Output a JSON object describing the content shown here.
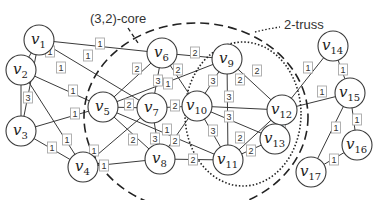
{
  "diagram": {
    "type": "weighted-graph",
    "annotations": {
      "core_label": "(3,2)-core",
      "truss_label": "2-truss"
    },
    "nodes": [
      {
        "id": "v1",
        "label": "v",
        "sub": "1",
        "x": 39,
        "y": 40
      },
      {
        "id": "v2",
        "label": "v",
        "sub": "2",
        "x": 21,
        "y": 70
      },
      {
        "id": "v3",
        "label": "v",
        "sub": "3",
        "x": 21,
        "y": 131
      },
      {
        "id": "v4",
        "label": "v",
        "sub": "4",
        "x": 83,
        "y": 167
      },
      {
        "id": "v5",
        "label": "v",
        "sub": "5",
        "x": 103,
        "y": 107
      },
      {
        "id": "v6",
        "label": "v",
        "sub": "6",
        "x": 162,
        "y": 53
      },
      {
        "id": "v7",
        "label": "v",
        "sub": "7",
        "x": 152,
        "y": 108
      },
      {
        "id": "v8",
        "label": "v",
        "sub": "8",
        "x": 160,
        "y": 159
      },
      {
        "id": "v9",
        "label": "v",
        "sub": "9",
        "x": 227,
        "y": 59
      },
      {
        "id": "v10",
        "label": "v",
        "sub": "10",
        "x": 197,
        "y": 106
      },
      {
        "id": "v11",
        "label": "v",
        "sub": "11",
        "x": 228,
        "y": 160
      },
      {
        "id": "v12",
        "label": "v",
        "sub": "12",
        "x": 282,
        "y": 110
      },
      {
        "id": "v13",
        "label": "v",
        "sub": "13",
        "x": 275,
        "y": 139
      },
      {
        "id": "v14",
        "label": "v",
        "sub": "14",
        "x": 333,
        "y": 46
      },
      {
        "id": "v15",
        "label": "v",
        "sub": "15",
        "x": 350,
        "y": 93
      },
      {
        "id": "v16",
        "label": "v",
        "sub": "16",
        "x": 357,
        "y": 145
      },
      {
        "id": "v17",
        "label": "v",
        "sub": "17",
        "x": 311,
        "y": 172
      }
    ],
    "edges": [
      {
        "from": "v1",
        "to": "v2",
        "weight": "1",
        "lx": 50,
        "ly": 52
      },
      {
        "from": "v1",
        "to": "v3",
        "weight": "1",
        "lx": 61,
        "ly": 68
      },
      {
        "from": "v1",
        "to": "v6",
        "weight": "1",
        "lx": 100,
        "ly": 44
      },
      {
        "from": "v1",
        "to": "v7",
        "weight": "1",
        "lx": 88,
        "ly": 56
      },
      {
        "from": "v2",
        "to": "v3",
        "weight": "3",
        "lx": 28,
        "ly": 98
      },
      {
        "from": "v2",
        "to": "v5",
        "weight": "1",
        "lx": 73,
        "ly": 91
      },
      {
        "from": "v2",
        "to": "v4",
        "weight": "1",
        "lx": 67,
        "ly": 140
      },
      {
        "from": "v3",
        "to": "v5",
        "weight": "1",
        "lx": 75,
        "ly": 114
      },
      {
        "from": "v3",
        "to": "v4",
        "weight": "1",
        "lx": 52,
        "ly": 148
      },
      {
        "from": "v4",
        "to": "v7",
        "weight": "1",
        "lx": 94,
        "ly": 151
      },
      {
        "from": "v4",
        "to": "v8",
        "weight": "1",
        "lx": 104,
        "ly": 166
      },
      {
        "from": "v5",
        "to": "v6",
        "weight": "2",
        "lx": 137,
        "ly": 69
      },
      {
        "from": "v5",
        "to": "v7",
        "weight": "2",
        "lx": 129,
        "ly": 105
      },
      {
        "from": "v5",
        "to": "v8",
        "weight": "2",
        "lx": 133,
        "ly": 140
      },
      {
        "from": "v5",
        "to": "v9",
        "weight": "1",
        "lx": 168,
        "ly": 84
      },
      {
        "from": "v5",
        "to": "v11",
        "weight": "1",
        "lx": 167,
        "ly": 130
      },
      {
        "from": "v6",
        "to": "v7",
        "weight": "3",
        "lx": 158,
        "ly": 81
      },
      {
        "from": "v6",
        "to": "v9",
        "weight": "2",
        "lx": 195,
        "ly": 53
      },
      {
        "from": "v6",
        "to": "v10",
        "weight": "2",
        "lx": 178,
        "ly": 70
      },
      {
        "from": "v7",
        "to": "v8",
        "weight": "3",
        "lx": 155,
        "ly": 139
      },
      {
        "from": "v7",
        "to": "v10",
        "weight": "2",
        "lx": 175,
        "ly": 106
      },
      {
        "from": "v8",
        "to": "v10",
        "weight": "2",
        "lx": 175,
        "ly": 141
      },
      {
        "from": "v8",
        "to": "v11",
        "weight": "2",
        "lx": 193,
        "ly": 160
      },
      {
        "from": "v9",
        "to": "v10",
        "weight": "3",
        "lx": 213,
        "ly": 81
      },
      {
        "from": "v9",
        "to": "v11",
        "weight": "2",
        "lx": 240,
        "ly": 80
      },
      {
        "from": "v9",
        "to": "v12",
        "weight": "2",
        "lx": 257,
        "ly": 71
      },
      {
        "from": "v10",
        "to": "v12",
        "weight": "3",
        "lx": 229,
        "ly": 97
      },
      {
        "from": "v10",
        "to": "v13",
        "weight": "3",
        "lx": 229,
        "ly": 117
      },
      {
        "from": "v10",
        "to": "v11",
        "weight": "3",
        "lx": 213,
        "ly": 131
      },
      {
        "from": "v11",
        "to": "v12",
        "weight": "2",
        "lx": 240,
        "ly": 138
      },
      {
        "from": "v11",
        "to": "v13",
        "weight": "2",
        "lx": 251,
        "ly": 151
      },
      {
        "from": "v12",
        "to": "v13",
        "weight": "3",
        "lx": 281,
        "ly": 128
      },
      {
        "from": "v12",
        "to": "v14",
        "weight": "1",
        "lx": 308,
        "ly": 68
      },
      {
        "from": "v12",
        "to": "v15",
        "weight": "1",
        "lx": 322,
        "ly": 92
      },
      {
        "from": "v14",
        "to": "v15",
        "weight": "1",
        "lx": 343,
        "ly": 70
      },
      {
        "from": "v15",
        "to": "v16",
        "weight": "1",
        "lx": 357,
        "ly": 120
      },
      {
        "from": "v15",
        "to": "v17",
        "weight": "1",
        "lx": 336,
        "ly": 128
      },
      {
        "from": "v16",
        "to": "v17",
        "weight": "1",
        "lx": 334,
        "ly": 160
      }
    ]
  }
}
